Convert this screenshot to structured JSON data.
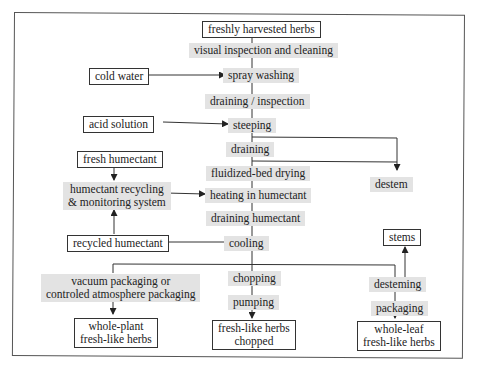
{
  "diagram": {
    "type": "process-flowchart",
    "nodes": {
      "start": "freshly harvested herbs",
      "inspect_clean": "visual inspection and cleaning",
      "cold_water": "cold water",
      "spray_washing": "spray washing",
      "drain_inspect": "draining / inspection",
      "acid_solution": "acid solution",
      "steeping": "steeping",
      "draining": "draining",
      "destem": "destem",
      "fresh_humectant": "fresh humectant",
      "fluid_bed": "fluidized-bed drying",
      "recycling_1": "humectant recycling",
      "recycling_2": "& monitoring system",
      "heating": "heating in humectant",
      "drain_humectant": "draining humectant",
      "recycled_humectant": "recycled humectant",
      "cooling": "cooling",
      "stems": "stems",
      "vacuum_1": "vacuum packaging or",
      "vacuum_2": "controled atmosphere packaging",
      "chopping": "chopping",
      "desteming": "desteming",
      "pumping": "pumping",
      "packaging": "packaging",
      "out_whole_plant_1": "whole-plant",
      "out_whole_plant_2": "fresh-like herbs",
      "out_chopped_1": "fresh-like herbs",
      "out_chopped_2": "chopped",
      "out_whole_leaf_1": "whole-leaf",
      "out_whole_leaf_2": "fresh-like herbs"
    },
    "edges": [
      [
        "freshly harvested herbs",
        "visual inspection and cleaning"
      ],
      [
        "visual inspection and cleaning",
        "spray washing"
      ],
      [
        "cold water",
        "spray washing"
      ],
      [
        "spray washing",
        "draining / inspection"
      ],
      [
        "draining / inspection",
        "steeping"
      ],
      [
        "acid solution",
        "steeping"
      ],
      [
        "steeping",
        "draining"
      ],
      [
        "steeping",
        "destem"
      ],
      [
        "draining",
        "fluidized-bed drying"
      ],
      [
        "draining",
        "destem"
      ],
      [
        "fluidized-bed drying",
        "heating in humectant"
      ],
      [
        "fresh humectant",
        "humectant recycling & monitoring system"
      ],
      [
        "humectant recycling & monitoring system",
        "heating in humectant"
      ],
      [
        "heating in humectant",
        "draining humectant"
      ],
      [
        "draining humectant",
        "cooling"
      ],
      [
        "cooling",
        "recycled humectant"
      ],
      [
        "recycled humectant",
        "humectant recycling & monitoring system"
      ],
      [
        "cooling",
        "chopping"
      ],
      [
        "cooling",
        "vacuum packaging or controled atmosphere packaging"
      ],
      [
        "cooling",
        "desteming"
      ],
      [
        "vacuum packaging or controled atmosphere packaging",
        "whole-plant fresh-like herbs"
      ],
      [
        "chopping",
        "pumping"
      ],
      [
        "pumping",
        "fresh-like herbs chopped"
      ],
      [
        "desteming",
        "stems"
      ],
      [
        "desteming",
        "packaging"
      ],
      [
        "packaging",
        "whole-leaf fresh-like herbs"
      ]
    ]
  }
}
